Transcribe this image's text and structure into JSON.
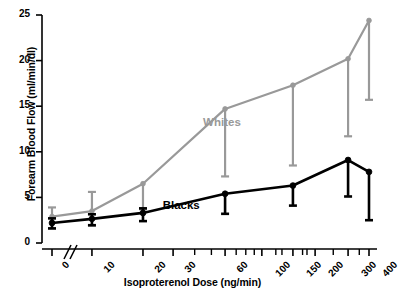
{
  "chart_data": {
    "type": "line",
    "title": "",
    "xlabel": "Isoproterenol Dose (ng/min)",
    "ylabel": "Forearm Blood Flow (ml/min/dl)",
    "xlim": [
      0,
      400
    ],
    "ylim": [
      0,
      25
    ],
    "yticks": [
      0,
      5,
      10,
      15,
      20,
      25
    ],
    "xticks": [
      0,
      10,
      20,
      30,
      60,
      100,
      150,
      200,
      300,
      400
    ],
    "xtick_labels": [
      "0",
      "10",
      "20",
      "30",
      "60",
      "100",
      "150",
      "200",
      "300",
      "400"
    ],
    "ytick_labels": [
      "0",
      "5",
      "10",
      "15",
      "20",
      "25"
    ],
    "x_axis_break": true,
    "x_axis_break_note": "//",
    "grid": false,
    "legend_position": "inline-annotations",
    "errorbar_direction": "lower",
    "series": [
      {
        "name": "Whites",
        "color": "#999999",
        "label_x": 60,
        "label_y": 13.0,
        "x": [
          0,
          10,
          20,
          60,
          150,
          300,
          400
        ],
        "values": [
          2.9,
          3.5,
          6.5,
          14.7,
          17.3,
          20.2,
          24.4
        ],
        "err_low": [
          1.3,
          1.6,
          2.8,
          7.4,
          8.8,
          8.5,
          8.7
        ],
        "err_high": [
          1.0,
          2.1,
          0.0,
          0.0,
          0.0,
          0.0,
          0.0
        ]
      },
      {
        "name": "Blacks",
        "color": "#000000",
        "label_x": 35,
        "label_y": 4.0,
        "x": [
          0,
          10,
          20,
          60,
          150,
          300,
          400
        ],
        "values": [
          2.2,
          2.65,
          3.3,
          5.4,
          6.3,
          9.1,
          7.8
        ],
        "err_low": [
          0.6,
          0.7,
          0.9,
          2.2,
          2.2,
          4.0,
          5.3
        ],
        "err_high": [
          0.5,
          0.5,
          0.5,
          0.0,
          0.0,
          0.0,
          0.0
        ]
      }
    ]
  }
}
